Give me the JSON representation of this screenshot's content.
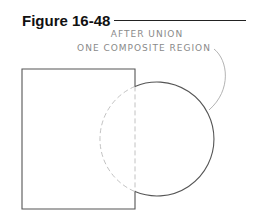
{
  "figure": {
    "title": "Figure 16-48",
    "annotation_line1": "AFTER UNION",
    "annotation_line2": "ONE COMPOSITE REGION"
  },
  "shapes": {
    "square": {
      "x": 22,
      "y": 69,
      "width": 113,
      "height": 140,
      "stroke": "#555555"
    },
    "circle": {
      "cx": 157,
      "cy": 139,
      "r": 57,
      "stroke": "#555555",
      "hidden_stroke": "#bbbbbb"
    },
    "hidden_edge_dash": "5,3"
  },
  "colors": {
    "outline": "#555555",
    "hidden": "#bbbbbb",
    "label": "#8a8a8a"
  }
}
